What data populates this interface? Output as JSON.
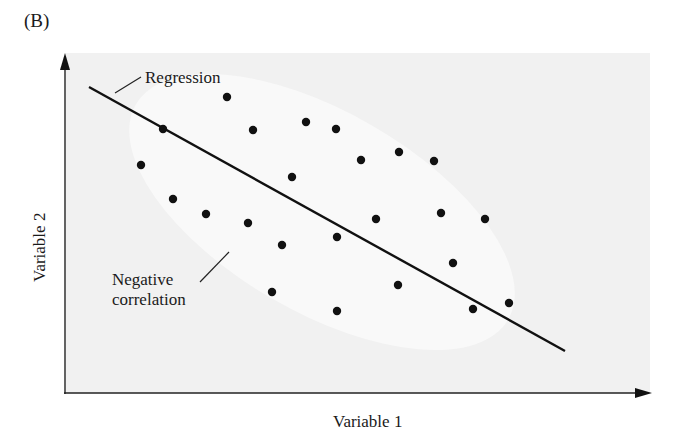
{
  "panel_label": "(B)",
  "chart_data": {
    "type": "scatter",
    "title": "",
    "xlabel": "Variable 1",
    "ylabel": "Variable 2",
    "grid": false,
    "legend": null,
    "axis_ticks": "none",
    "annotations": [
      {
        "text": "Regression",
        "target": "regression-line"
      },
      {
        "text": "Negative correlation",
        "target": "point-cloud-ellipse"
      }
    ],
    "regression_line": {
      "x1": 89,
      "y1": 87,
      "x2": 565,
      "y2": 351
    },
    "points_pixel": [
      [
        227,
        97
      ],
      [
        163,
        129
      ],
      [
        253,
        130
      ],
      [
        306,
        122
      ],
      [
        336,
        129
      ],
      [
        141,
        165
      ],
      [
        292,
        177
      ],
      [
        173,
        199
      ],
      [
        206,
        214
      ],
      [
        248,
        223
      ],
      [
        361,
        160
      ],
      [
        399,
        152
      ],
      [
        434,
        161
      ],
      [
        376,
        219
      ],
      [
        441,
        213
      ],
      [
        485,
        219
      ],
      [
        337,
        237
      ],
      [
        282,
        245
      ],
      [
        272,
        292
      ],
      [
        337,
        311
      ],
      [
        398,
        285
      ],
      [
        453,
        263
      ],
      [
        473,
        309
      ],
      [
        509,
        303
      ]
    ],
    "relationship": "negative correlation"
  },
  "colors": {
    "plot_bg": "#f1f1f1",
    "ellipse": "#f9f9f9",
    "ink": "#111111"
  }
}
